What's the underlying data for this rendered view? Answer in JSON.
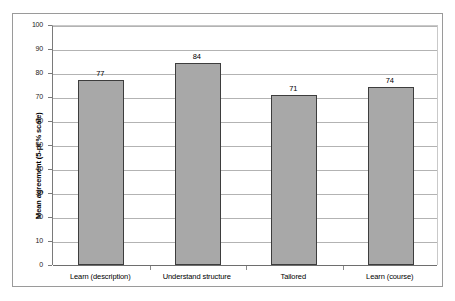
{
  "chart_data": {
    "type": "bar",
    "title": "",
    "subtitle": "",
    "categories": [
      "Learn (description)",
      "Understand structure",
      "Tailored",
      "Learn (course)"
    ],
    "values": [
      77,
      84,
      71,
      74
    ],
    "data_labels": [
      "77",
      "84",
      "71",
      "74"
    ],
    "xlabel": "",
    "ylabel": "Mean agreement (5-pt % scale)",
    "ylim": [
      0,
      100
    ],
    "ytick_step": 10,
    "yticks": [
      0,
      10,
      20,
      30,
      40,
      50,
      60,
      70,
      80,
      90,
      100
    ],
    "ytick_labels": [
      "0",
      "10",
      "20",
      "30",
      "40",
      "50",
      "60",
      "70",
      "80",
      "90",
      "100"
    ],
    "grid": true,
    "grid_axis": "y",
    "legend": false,
    "legend_position": "none",
    "series": [
      {
        "name": "",
        "values": [
          77,
          84,
          71,
          74
        ],
        "color": "#a8a8a8",
        "border_color": "#3d3d3d"
      }
    ]
  },
  "style": {
    "bar_fill": "#a8a8a8",
    "bar_border": "#3d3d3d",
    "gridline_color": "#b3b3b3",
    "axis_color": "#7a7a7a",
    "frame_color": "#9a9a9a",
    "background": "#ffffff",
    "text_color": "#000000"
  }
}
